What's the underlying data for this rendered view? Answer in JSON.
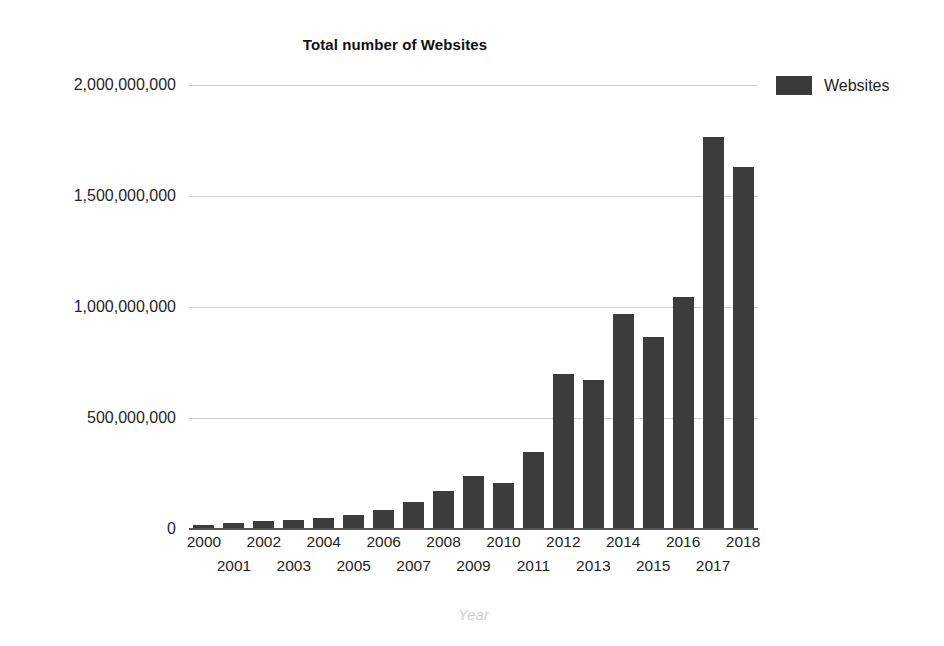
{
  "chart_data": {
    "type": "bar",
    "title": "Total number of Websites",
    "xlabel": "Year",
    "ylabel": "",
    "categories": [
      "2000",
      "2001",
      "2002",
      "2003",
      "2004",
      "2005",
      "2006",
      "2007",
      "2008",
      "2009",
      "2010",
      "2011",
      "2012",
      "2013",
      "2014",
      "2015",
      "2016",
      "2017",
      "2018"
    ],
    "values": [
      17000000,
      29000000,
      38000000,
      40000000,
      51000000,
      64000000,
      85000000,
      121000000,
      172000000,
      238000000,
      207000000,
      346000000,
      697000000,
      672000000,
      968000000,
      863000000,
      1045000000,
      1766000000,
      1630000000
    ],
    "series": [
      {
        "name": "Websites",
        "values": [
          17000000,
          29000000,
          38000000,
          40000000,
          51000000,
          64000000,
          85000000,
          121000000,
          172000000,
          238000000,
          207000000,
          346000000,
          697000000,
          672000000,
          968000000,
          863000000,
          1045000000,
          1766000000,
          1630000000
        ]
      }
    ],
    "ylim": [
      0,
      2000000000
    ],
    "yticks": [
      0,
      500000000,
      1000000000,
      1500000000,
      2000000000
    ],
    "ytick_labels": [
      "0",
      "500,000,000",
      "1,000,000,000",
      "1,500,000,000",
      "2,000,000,000"
    ],
    "grid": true,
    "legend": {
      "position": "top-right",
      "entries": [
        {
          "label": "Websites",
          "color": "#3c3c3c"
        }
      ]
    },
    "bar_color": "#3c3c3c",
    "gridline_color": "#d0d0d0",
    "axis_color": "#555555",
    "axis_title_color": "#cfcfcf"
  }
}
